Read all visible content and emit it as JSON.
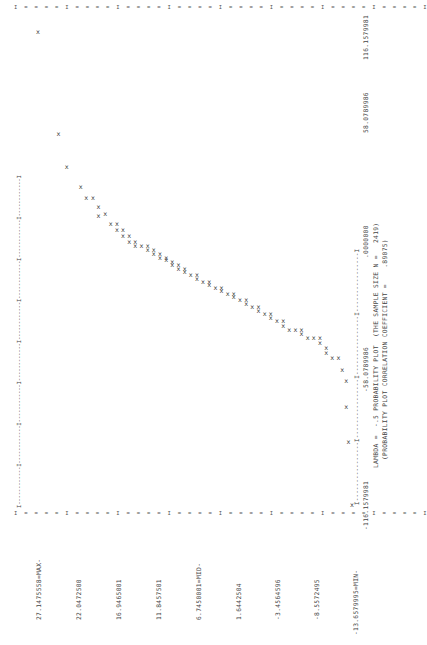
{
  "chart_data": {
    "type": "scatter",
    "title": "LAMBDA = -.5 PROBABILITY PLOT (THE SAMPLE SIZE N = 2419)",
    "subtitle": "(PROBABILITY PLOT CORRELATION COEFFICIENT = .89075)",
    "orientation": "page rotated 90 degrees counter-clockwise (line-printer output)",
    "xlabel": "Theoretical quantiles (Tukey lambda = -.5)",
    "ylabel": "Ordered data values",
    "x_ticks": [
      "-116.1579981",
      "-58.0789986",
      ".0000000",
      "58.0789986",
      "116.1579981"
    ],
    "y_ticks": [
      "27.1475558=MAX",
      "22.0472500",
      "16.9465001",
      "11.8457501",
      "6.7450001=MID",
      "1.6442504",
      "-3.4564596",
      "-8.5572495",
      "-13.6579995=MIN"
    ],
    "xlim": [
      -116.1579981,
      116.1579981
    ],
    "ylim": [
      -13.6579995,
      27.1475558
    ],
    "grid": false,
    "marker": "X",
    "points": [
      {
        "x": 116.16,
        "y": 27.15
      },
      {
        "x": 66.0,
        "y": 24.5
      },
      {
        "x": 50.0,
        "y": 23.4
      },
      {
        "x": 40.0,
        "y": 21.6
      },
      {
        "x": 34.5,
        "y": 20.9
      },
      {
        "x": 34.5,
        "y": 20.0
      },
      {
        "x": 30.0,
        "y": 19.3
      },
      {
        "x": 26.0,
        "y": 19.3
      },
      {
        "x": 27.0,
        "y": 18.4
      },
      {
        "x": 22.0,
        "y": 17.7
      },
      {
        "x": 22.0,
        "y": 16.9
      },
      {
        "x": 19.0,
        "y": 16.9
      },
      {
        "x": 19.0,
        "y": 16.1
      },
      {
        "x": 16.0,
        "y": 16.1
      },
      {
        "x": 16.0,
        "y": 15.3
      },
      {
        "x": 13.0,
        "y": 15.3
      },
      {
        "x": 13.0,
        "y": 14.5
      },
      {
        "x": 11.0,
        "y": 14.5
      },
      {
        "x": 11.0,
        "y": 13.7
      },
      {
        "x": 11.0,
        "y": 12.9
      },
      {
        "x": 9.0,
        "y": 12.9
      },
      {
        "x": 9.0,
        "y": 12.1
      },
      {
        "x": 7.0,
        "y": 12.1
      },
      {
        "x": 7.0,
        "y": 11.3
      },
      {
        "x": 5.0,
        "y": 11.3
      },
      {
        "x": 5.0,
        "y": 10.5
      },
      {
        "x": 4.0,
        "y": 10.5
      },
      {
        "x": 3.0,
        "y": 9.7
      },
      {
        "x": 1.5,
        "y": 9.7
      },
      {
        "x": 1.5,
        "y": 8.9
      },
      {
        "x": 0.0,
        "y": 8.9
      },
      {
        "x": 0.0,
        "y": 8.1
      },
      {
        "x": -1.5,
        "y": 8.1
      },
      {
        "x": -3.0,
        "y": 7.3
      },
      {
        "x": -3.0,
        "y": 6.5
      },
      {
        "x": -5.0,
        "y": 6.5
      },
      {
        "x": -6.5,
        "y": 5.7
      },
      {
        "x": -6.5,
        "y": 4.9
      },
      {
        "x": -8.0,
        "y": 4.9
      },
      {
        "x": -9.5,
        "y": 4.1
      },
      {
        "x": -9.5,
        "y": 3.3
      },
      {
        "x": -11.0,
        "y": 3.3
      },
      {
        "x": -12.5,
        "y": 2.5
      },
      {
        "x": -12.5,
        "y": 1.7
      },
      {
        "x": -14.0,
        "y": 1.7
      },
      {
        "x": -15.5,
        "y": 0.9
      },
      {
        "x": -15.5,
        "y": 0.1
      },
      {
        "x": -17.5,
        "y": 0.1
      },
      {
        "x": -19.0,
        "y": -0.7
      },
      {
        "x": -19.0,
        "y": -1.5
      },
      {
        "x": -21.0,
        "y": -1.5
      },
      {
        "x": -22.5,
        "y": -2.3
      },
      {
        "x": -22.5,
        "y": -3.1
      },
      {
        "x": -24.5,
        "y": -3.1
      },
      {
        "x": -26.0,
        "y": -3.9
      },
      {
        "x": -26.0,
        "y": -4.7
      },
      {
        "x": -28.0,
        "y": -4.7
      },
      {
        "x": -30.0,
        "y": -5.5
      },
      {
        "x": -30.0,
        "y": -6.3
      },
      {
        "x": -30.0,
        "y": -7.1
      },
      {
        "x": -32.0,
        "y": -7.1
      },
      {
        "x": -34.0,
        "y": -7.9
      },
      {
        "x": -34.0,
        "y": -8.7
      },
      {
        "x": -34.0,
        "y": -9.5
      },
      {
        "x": -36.5,
        "y": -9.5
      },
      {
        "x": -39.0,
        "y": -10.3
      },
      {
        "x": -41.5,
        "y": -10.3
      },
      {
        "x": -44.0,
        "y": -11.1
      },
      {
        "x": -44.0,
        "y": -11.9
      },
      {
        "x": -50.0,
        "y": -12.4
      },
      {
        "x": -55.0,
        "y": -12.9
      },
      {
        "x": -68.0,
        "y": -12.9
      },
      {
        "x": -85.0,
        "y": -13.2
      },
      {
        "x": -116.16,
        "y": -13.66
      }
    ]
  },
  "labels": {
    "y_ticks": [
      "27.1475558=MAX-",
      "22.0472500",
      "16.9465001",
      "11.8457501",
      "6.7450001=MID-",
      "1.6442504",
      "-3.4564596",
      "-8.5572495",
      "-13.6579995=MIN-"
    ],
    "x_ticks": [
      "-116.1579981",
      "-58.0789986",
      ".0000000",
      "58.0789986",
      "116.1579981"
    ],
    "caption_line1": "LAMBDA =  -.5 PROBABILITY PLOT  (THE SAMPLE SIZE N =   2419)",
    "caption_line2": "(PROBABILITY PLOT CORRELATION COEFFICIENT =    .89075)",
    "x_axis_rule": "I----------------I----------------I----------------I----------------I",
    "top_tick_row": "I  =  =  =  =  I  =  =  =  =  I  =  =  =  =  I  =  =  =  =  I  =  =  =  =  I  =  =  =  =  I  =  =  =  =  I  =  =  =  =  I",
    "left_rule": "I------------I------------I------------I------------I------------I------------I------------I------------I",
    "marker": "x"
  }
}
